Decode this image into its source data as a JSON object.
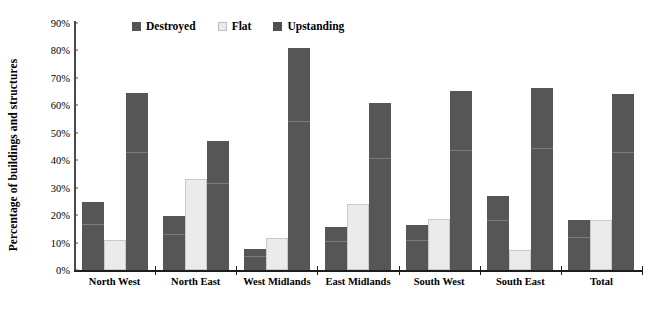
{
  "chart_data": {
    "type": "bar",
    "title": "",
    "xlabel": "",
    "ylabel": "Percentage of buildings and structures",
    "ylim": [
      0,
      90
    ],
    "ytick_labels": [
      "90%",
      "80%",
      "70%",
      "60%",
      "50%",
      "40%",
      "30%",
      "20%",
      "10%",
      "0%"
    ],
    "ytick_values": [
      90,
      80,
      70,
      60,
      50,
      40,
      30,
      20,
      10,
      0
    ],
    "grid": false,
    "legend_position": "top-center",
    "categories": [
      "North West",
      "North East",
      "West Midlands",
      "East Midlands",
      "South West",
      "South East",
      "Total"
    ],
    "series": [
      {
        "name": "Destroyed",
        "color": "#565656",
        "values": [
          24.8,
          19.7,
          7.7,
          15.6,
          16.3,
          27.0,
          18.1
        ]
      },
      {
        "name": "Flat",
        "color": "#ebebeb",
        "values": [
          10.8,
          33.3,
          11.5,
          24.0,
          18.7,
          7.4,
          18.4
        ]
      },
      {
        "name": "Upstanding",
        "color": "#565656",
        "values": [
          64.4,
          47.1,
          80.8,
          60.9,
          65.4,
          66.2,
          64.1
        ]
      }
    ]
  },
  "legend": {
    "items": [
      {
        "label": "Destroyed",
        "swatch": "destroyed"
      },
      {
        "label": "Flat",
        "swatch": "flat"
      },
      {
        "label": "Upstanding",
        "swatch": "upstanding"
      }
    ]
  },
  "colors": {
    "dark_bar": "#565656",
    "light_bar": "#ebebeb",
    "axis": "#1d1d1d",
    "background": "#ffffff"
  }
}
